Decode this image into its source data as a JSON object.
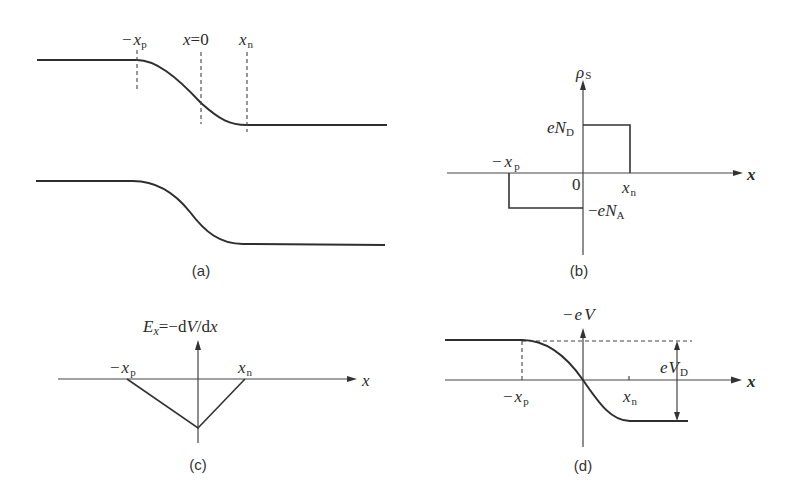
{
  "figure": {
    "panels": {
      "a": {
        "caption": "(a)",
        "description": "Energy band edges across p-n junction",
        "label_neg_xp": {
          "sign": "−",
          "main": "x",
          "sub": "p"
        },
        "label_x0": {
          "main": "x",
          "rest": "=0"
        },
        "label_xn": {
          "main": "x",
          "sub": "n"
        }
      },
      "b": {
        "caption": "(b)",
        "y_axis": {
          "main": "ρ",
          "sub": "S"
        },
        "x_axis": "x",
        "origin": "0",
        "label_neg_xp": {
          "sign": "−",
          "main": "x",
          "sub": "p"
        },
        "label_xn": {
          "main": "x",
          "sub": "n"
        },
        "label_eND": {
          "main": "eN",
          "sub": "D"
        },
        "label_neg_eNA": {
          "sign": "−",
          "main": "eN",
          "sub": "A"
        }
      },
      "c": {
        "caption": "(c)",
        "y_axis": {
          "e": "E",
          "e_sub": "x",
          "eq": "=−d",
          "v": "V",
          "slash": "/d",
          "x": "x"
        },
        "x_axis": "x",
        "label_neg_xp": {
          "sign": "−",
          "main": "x",
          "sub": "p"
        },
        "label_xn": {
          "main": "x",
          "sub": "n"
        }
      },
      "d": {
        "caption": "(d)",
        "y_axis": {
          "sign": "−",
          "main": "eV"
        },
        "x_axis": "x",
        "label_neg_xp": {
          "sign": "−",
          "main": "x",
          "sub": "p"
        },
        "label_xn": {
          "main": "x",
          "sub": "n"
        },
        "label_eVD": {
          "main": "eV",
          "sub": "D"
        }
      }
    },
    "colors": {
      "ink": "#2e2e2e",
      "background": "#ffffff"
    }
  }
}
